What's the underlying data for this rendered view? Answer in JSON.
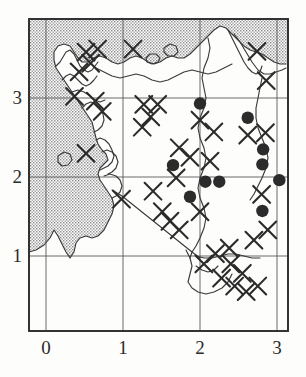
{
  "figure": {
    "kind": "distribution-map",
    "background_color": "#fdfdfc",
    "ink_color": "#2b2b2b",
    "sea_fill_color": "#b9b9b9",
    "land_fill_color": "#ffffff"
  },
  "axes": {
    "x_ticks": [
      {
        "label": "0",
        "value": 0,
        "px": 46
      },
      {
        "label": "1",
        "value": 1,
        "px": 123
      },
      {
        "label": "2",
        "value": 2,
        "px": 200
      },
      {
        "label": "3",
        "value": 3,
        "px": 277
      }
    ],
    "y_ticks": [
      {
        "label": "3",
        "value": 3,
        "px": 98
      },
      {
        "label": "2",
        "value": 2,
        "px": 177
      },
      {
        "label": "1",
        "value": 1,
        "px": 256
      }
    ],
    "frame": {
      "left": 29,
      "top": 19,
      "right": 288,
      "bottom": 331
    },
    "xlabel": "",
    "ylabel": "",
    "xlim": [
      -0.22,
      3.14
    ],
    "ylim": [
      0.05,
      3.95
    ],
    "grid": true
  },
  "chart_data": {
    "type": "scatter",
    "title": "",
    "xlabel": "",
    "ylabel": "",
    "xlim": [
      -0.22,
      3.14
    ],
    "ylim": [
      0.05,
      3.95
    ],
    "grid": true,
    "series": [
      {
        "name": "filled-circle-records",
        "marker": "filled-circle",
        "color": "#2b2b2b",
        "points": [
          {
            "x": 2.0,
            "y": 2.93
          },
          {
            "x": 2.62,
            "y": 2.75
          },
          {
            "x": 2.82,
            "y": 2.35
          },
          {
            "x": 2.81,
            "y": 2.16
          },
          {
            "x": 1.65,
            "y": 2.15
          },
          {
            "x": 2.07,
            "y": 1.94
          },
          {
            "x": 2.25,
            "y": 1.94
          },
          {
            "x": 3.03,
            "y": 1.96
          },
          {
            "x": 1.87,
            "y": 1.75
          },
          {
            "x": 2.81,
            "y": 1.57
          }
        ]
      },
      {
        "name": "cross-records",
        "marker": "cross",
        "color": "#2b2b2b",
        "points": [
          {
            "x": 0.52,
            "y": 3.58
          },
          {
            "x": 0.67,
            "y": 3.62
          },
          {
            "x": 0.58,
            "y": 3.44
          },
          {
            "x": 0.43,
            "y": 3.33
          },
          {
            "x": 1.13,
            "y": 3.62
          },
          {
            "x": 2.74,
            "y": 3.59
          },
          {
            "x": 2.86,
            "y": 3.22
          },
          {
            "x": 0.37,
            "y": 3.02
          },
          {
            "x": 0.64,
            "y": 2.96
          },
          {
            "x": 0.73,
            "y": 2.83
          },
          {
            "x": 1.27,
            "y": 2.92
          },
          {
            "x": 1.45,
            "y": 2.92
          },
          {
            "x": 1.36,
            "y": 2.76
          },
          {
            "x": 1.25,
            "y": 2.63
          },
          {
            "x": 2.0,
            "y": 2.72
          },
          {
            "x": 2.18,
            "y": 2.57
          },
          {
            "x": 2.62,
            "y": 2.53
          },
          {
            "x": 2.85,
            "y": 2.56
          },
          {
            "x": 1.73,
            "y": 2.37
          },
          {
            "x": 1.87,
            "y": 2.25
          },
          {
            "x": 0.52,
            "y": 2.3
          },
          {
            "x": 2.13,
            "y": 2.2
          },
          {
            "x": 1.69,
            "y": 1.99
          },
          {
            "x": 1.39,
            "y": 1.82
          },
          {
            "x": 0.98,
            "y": 1.72
          },
          {
            "x": 2.8,
            "y": 1.78
          },
          {
            "x": 1.51,
            "y": 1.56
          },
          {
            "x": 1.61,
            "y": 1.44
          },
          {
            "x": 1.73,
            "y": 1.33
          },
          {
            "x": 2.0,
            "y": 1.56
          },
          {
            "x": 2.88,
            "y": 1.33
          },
          {
            "x": 2.7,
            "y": 1.2
          },
          {
            "x": 2.38,
            "y": 1.1
          },
          {
            "x": 2.2,
            "y": 1.03
          },
          {
            "x": 2.05,
            "y": 0.9
          },
          {
            "x": 2.28,
            "y": 0.72
          },
          {
            "x": 2.45,
            "y": 0.62
          },
          {
            "x": 2.6,
            "y": 0.55
          },
          {
            "x": 2.75,
            "y": 0.62
          },
          {
            "x": 2.55,
            "y": 0.78
          },
          {
            "x": 2.4,
            "y": 0.9
          }
        ]
      }
    ]
  },
  "legend": {
    "visible": false,
    "entries": []
  }
}
